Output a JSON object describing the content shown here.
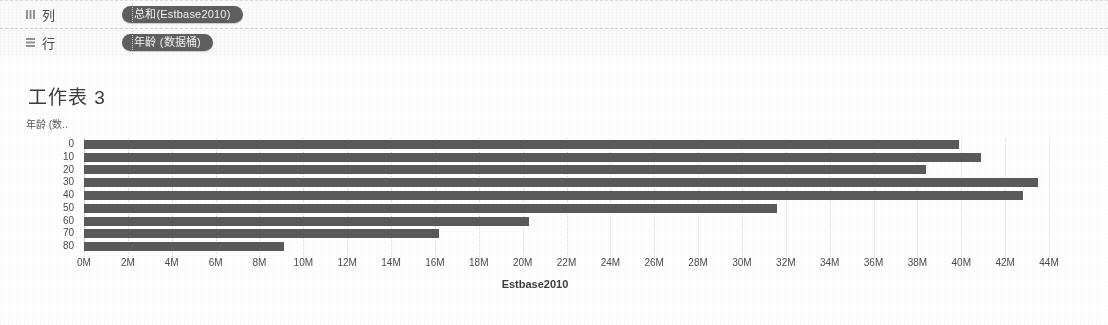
{
  "shelves": [
    {
      "name": "columns",
      "label": "列",
      "icon": "columns-grid-icon",
      "pill": "总和(Estbase2010)"
    },
    {
      "name": "rows",
      "label": "行",
      "icon": "rows-grid-icon",
      "pill": "年龄 (数据桶)"
    }
  ],
  "worksheet": {
    "title": "工作表 3",
    "row_axis_title": "年龄 (数.."
  },
  "chart_data": {
    "type": "bar",
    "orientation": "horizontal",
    "title": "工作表 3",
    "xlabel": "Estbase2010",
    "ylabel": "年龄 (数..",
    "categories": [
      "0",
      "10",
      "20",
      "30",
      "40",
      "50",
      "60",
      "70",
      "80"
    ],
    "values": [
      39900000,
      40900000,
      38400000,
      43500000,
      42800000,
      31600000,
      20300000,
      16200000,
      9100000
    ],
    "value_labels": [
      "39.9M",
      "40.9M",
      "38.4M",
      "43.5M",
      "42.8M",
      "31.6M",
      "20.3M",
      "16.2M",
      "9.1M"
    ],
    "xlim": [
      0,
      44000000
    ],
    "xtick_values": [
      0,
      2000000,
      4000000,
      6000000,
      8000000,
      10000000,
      12000000,
      14000000,
      16000000,
      18000000,
      20000000,
      22000000,
      24000000,
      26000000,
      28000000,
      30000000,
      32000000,
      34000000,
      36000000,
      38000000,
      40000000,
      42000000,
      44000000
    ],
    "xtick_labels": [
      "0M",
      "2M",
      "4M",
      "6M",
      "8M",
      "10M",
      "12M",
      "14M",
      "16M",
      "18M",
      "20M",
      "22M",
      "24M",
      "26M",
      "28M",
      "30M",
      "32M",
      "34M",
      "36M",
      "38M",
      "40M",
      "42M",
      "44M"
    ],
    "grid": true,
    "legend": null,
    "bar_color": "#5a5a5a"
  },
  "colors": {
    "bar": "#5a5a5a",
    "pill": "#5f5f5f",
    "shelf_bg": "#fafafa",
    "text": "#3c3c3c"
  }
}
